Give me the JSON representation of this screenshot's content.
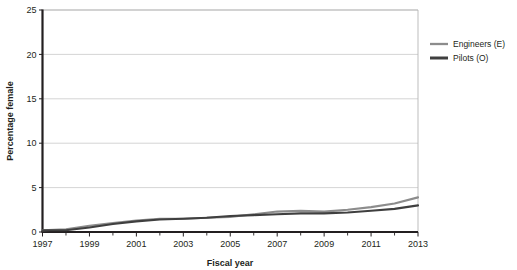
{
  "chart_data": {
    "type": "line",
    "title": "",
    "xlabel": "Fiscal year",
    "ylabel": "Percentage female",
    "xlim": [
      1997,
      2013
    ],
    "ylim": [
      0,
      25
    ],
    "yticks": [
      0,
      5,
      10,
      15,
      20,
      25
    ],
    "xticks": [
      1997,
      1999,
      2001,
      2003,
      2005,
      2007,
      2009,
      2011,
      2013
    ],
    "xticks_minor": [
      1998,
      2000,
      2002,
      2004,
      2006,
      2008,
      2010,
      2012
    ],
    "grid": "horizontal",
    "legend_position": "right",
    "x": [
      1997,
      1998,
      1999,
      2000,
      2001,
      2002,
      2003,
      2004,
      2005,
      2006,
      2007,
      2008,
      2009,
      2010,
      2011,
      2012,
      2013
    ],
    "series": [
      {
        "name": "Engineers (E)",
        "color": "#8c8c8c",
        "values": [
          0.2,
          0.3,
          0.7,
          1.0,
          1.3,
          1.5,
          1.5,
          1.6,
          1.7,
          2.0,
          2.3,
          2.4,
          2.3,
          2.5,
          2.8,
          3.2,
          3.9
        ]
      },
      {
        "name": "Pilots (O)",
        "color": "#3f3f3f",
        "values": [
          0.2,
          0.2,
          0.5,
          0.9,
          1.2,
          1.4,
          1.5,
          1.6,
          1.8,
          1.9,
          2.0,
          2.1,
          2.1,
          2.2,
          2.4,
          2.6,
          3.0
        ]
      }
    ],
    "ytick_labels": [
      "0",
      "5",
      "10",
      "15",
      "20",
      "25"
    ],
    "xtick_labels": [
      "1997",
      "1999",
      "2001",
      "2003",
      "2005",
      "2007",
      "2009",
      "2011",
      "2013"
    ],
    "colors": {
      "axis": "#231f20",
      "gridline": "#c9c9c9",
      "plot_border": "#b5b5b5",
      "background": "#ffffff"
    }
  },
  "legend": {
    "items": [
      {
        "label": "Engineers (E)",
        "swatch": "#8c8c8c"
      },
      {
        "label": "Pilots (O)",
        "swatch": "#3f3f3f"
      }
    ]
  }
}
